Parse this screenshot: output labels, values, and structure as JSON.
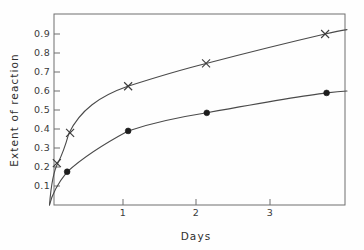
{
  "chart_data": {
    "type": "line",
    "title": "",
    "xlabel": "Days",
    "ylabel": "Extent of reaction",
    "xlim": [
      0,
      3.95
    ],
    "ylim": [
      0,
      0.97
    ],
    "grid": false,
    "legend": "none",
    "x_ticks": [
      "1",
      "2",
      "3"
    ],
    "x_tick_values": [
      1,
      2,
      3
    ],
    "y_ticks": [
      "0.1",
      "0.2",
      "0.3",
      "0.4",
      "0.5",
      "0.6",
      "0.7",
      "0.8",
      "0.9"
    ],
    "y_tick_values": [
      0.1,
      0.2,
      0.3,
      0.4,
      0.5,
      0.6,
      0.7,
      0.8,
      0.9
    ],
    "series": [
      {
        "name": "upper-curve",
        "marker": "cross",
        "x": [
          0.1,
          0.28,
          1.07,
          2.13,
          3.75
        ],
        "values": [
          0.22,
          0.38,
          0.625,
          0.745,
          0.9
        ]
      },
      {
        "name": "lower-curve",
        "marker": "filled-circle",
        "x": [
          0.24,
          1.07,
          2.14,
          3.77
        ],
        "values": [
          0.175,
          0.39,
          0.485,
          0.59
        ]
      }
    ],
    "curve_paths": {
      "upper": "M 49.5,205 C 51,186 53,172 57.8,163.2 C 62,155 65,147 68.7,133.8 C 80,110 100,96 127.8,86.3 C 160,76 180,70 206.1,63.5 C 250,52 295,41 325.1,34.0 C 334,31.8 341,30.4 347,29.6",
      "lower": "M 49.5,205 C 52,194 58,183 67.1,171.8 C 80,160 100,146 128.1,130.9 C 155,122 180,117 206.8,112.8 C 250,105 300,96 326.9,92.9 C 335,91.9 342,91.3 347,91.0"
    },
    "colors": {
      "curve": "#4a4a4a",
      "marker_cross": "#3c3c3c",
      "marker_dot": "#1d1d1d",
      "axis": "#6f6f6f",
      "text": "#2e2e2e",
      "background": "#fefefe"
    }
  }
}
